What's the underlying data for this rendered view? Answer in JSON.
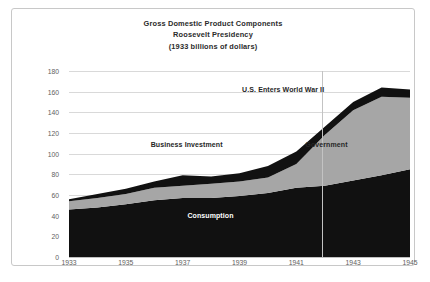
{
  "chart_data": {
    "type": "area",
    "title": "Gross Domestic Product Components",
    "subtitle": "Roosevelt Presidency",
    "units": "(1933 billions of dollars)",
    "xlabel": "",
    "ylabel": "",
    "stacked": true,
    "grid": true,
    "legend_position": "inline-annotations",
    "xlim": [
      1933,
      1945
    ],
    "ylim": [
      0,
      180
    ],
    "ytick_step": 20,
    "yticks": [
      "180",
      "160",
      "140",
      "120",
      "100",
      "80",
      "60",
      "40",
      "20",
      "0"
    ],
    "xticks": [
      "1933",
      "1935",
      "1937",
      "1939",
      "1941",
      "1943",
      "1945"
    ],
    "x": [
      1933,
      1934,
      1935,
      1936,
      1937,
      1938,
      1939,
      1940,
      1941,
      1942,
      1943,
      1944,
      1945
    ],
    "series": [
      {
        "name": "Consumption",
        "color": "#111111",
        "values": [
          46,
          48,
          51,
          55,
          57,
          57,
          59,
          62,
          67,
          69,
          74,
          79,
          85
        ]
      },
      {
        "name": "Government",
        "color": "#a6a6a6",
        "values": [
          8,
          9,
          10,
          12,
          12,
          14,
          14,
          15,
          23,
          49,
          68,
          76,
          69
        ]
      },
      {
        "name": "Business Investment",
        "color": "#111111",
        "values": [
          2,
          4,
          5,
          6,
          10,
          7,
          8,
          11,
          12,
          8,
          8,
          9,
          8
        ]
      }
    ],
    "totals": [
      56,
      61,
      66,
      73,
      79,
      78,
      81,
      88,
      102,
      126,
      150,
      164,
      162
    ],
    "annotations": [
      {
        "text": "U.S. Enters World War II",
        "x_frac": 0.628,
        "y_frac": 0.095,
        "style": "dark"
      },
      {
        "text": "Business Investment",
        "x_frac": 0.345,
        "y_frac": 0.395,
        "style": "dark"
      },
      {
        "text": "Government",
        "x_frac": 0.755,
        "y_frac": 0.395,
        "style": "dark"
      },
      {
        "text": "Consumption",
        "x_frac": 0.415,
        "y_frac": 0.775,
        "style": "light"
      }
    ],
    "marker_line": {
      "label": "U.S. Enters World War II",
      "x": 1941.9,
      "color": "#c3c3c3"
    }
  }
}
